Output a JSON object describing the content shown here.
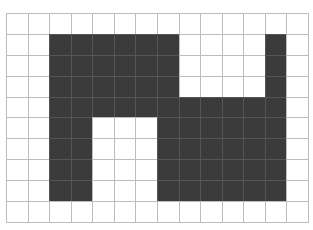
{
  "header": {
    "title_cut_off": ""
  },
  "grid": {
    "columns": 14,
    "rows": 10,
    "colors": {
      "filled": "#3b3b3b",
      "empty": "#ffffff",
      "grid_line": "#bdbdbd",
      "filled_grid_line": "#555555"
    },
    "cells": [
      [
        0,
        0,
        0,
        0,
        0,
        0,
        0,
        0,
        0,
        0,
        0,
        0,
        0,
        0
      ],
      [
        0,
        0,
        1,
        1,
        1,
        1,
        1,
        1,
        0,
        0,
        0,
        0,
        1,
        0
      ],
      [
        0,
        0,
        1,
        1,
        1,
        1,
        1,
        1,
        0,
        0,
        0,
        0,
        1,
        0
      ],
      [
        0,
        0,
        1,
        1,
        1,
        1,
        1,
        1,
        0,
        0,
        0,
        0,
        1,
        0
      ],
      [
        0,
        0,
        1,
        1,
        1,
        1,
        1,
        1,
        1,
        1,
        1,
        1,
        1,
        0
      ],
      [
        0,
        0,
        1,
        1,
        0,
        0,
        0,
        1,
        1,
        1,
        1,
        1,
        1,
        0
      ],
      [
        0,
        0,
        1,
        1,
        0,
        0,
        0,
        1,
        1,
        1,
        1,
        1,
        1,
        0
      ],
      [
        0,
        0,
        1,
        1,
        0,
        0,
        0,
        1,
        1,
        1,
        1,
        1,
        1,
        0
      ],
      [
        0,
        0,
        1,
        1,
        0,
        0,
        0,
        1,
        1,
        1,
        1,
        1,
        1,
        0
      ],
      [
        0,
        0,
        0,
        0,
        0,
        0,
        0,
        0,
        0,
        0,
        0,
        0,
        0,
        0
      ]
    ]
  }
}
